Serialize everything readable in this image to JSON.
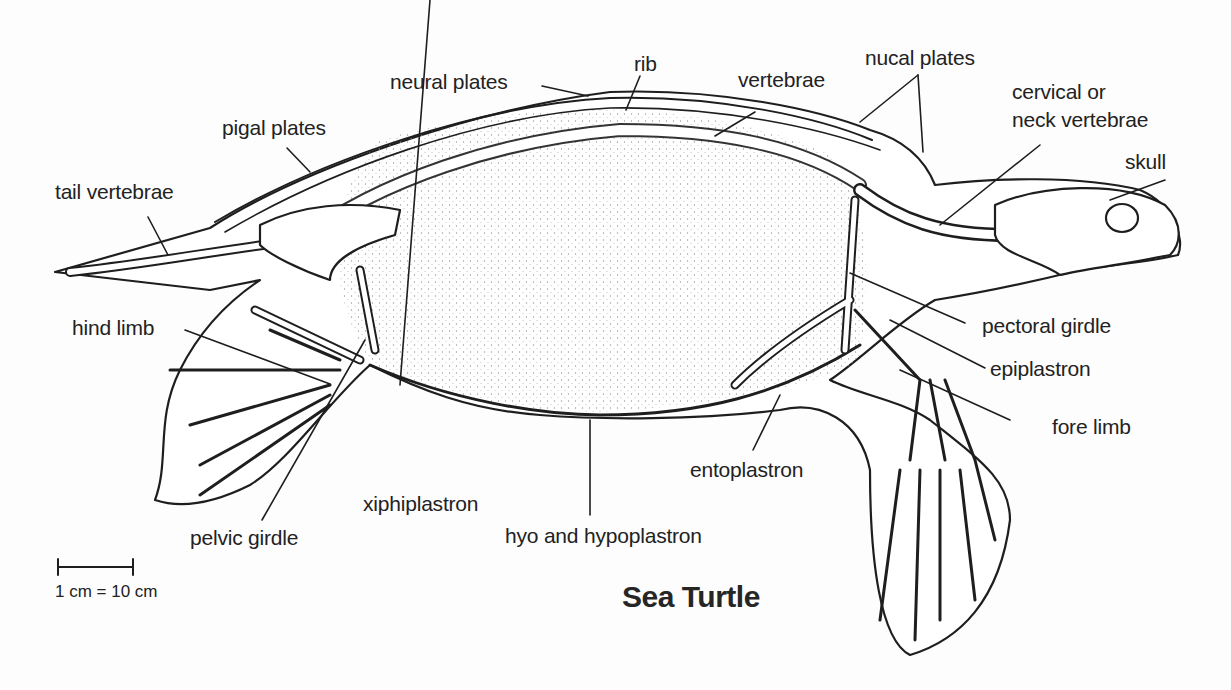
{
  "title": "Sea Turtle",
  "scale": {
    "label": "1 cm = 10 cm"
  },
  "labels": {
    "neural_plates": "neural plates",
    "rib": "rib",
    "vertebrae": "vertebrae",
    "nucal_plates": "nucal plates",
    "cervical_line1": "cervical or",
    "cervical_line2": "neck vertebrae",
    "skull": "skull",
    "pigal_plates": "pigal plates",
    "tail_vertebrae": "tail vertebrae",
    "hind_limb": "hind limb",
    "pectoral_girdle": "pectoral girdle",
    "epiplastron": "epiplastron",
    "fore_limb": "fore limb",
    "entoplastron": "entoplastron",
    "xiphiplastron": "xiphiplastron",
    "pelvic_girdle": "pelvic girdle",
    "hyo_and_hypoplastron": "hyo and hypoplastron"
  },
  "colors": {
    "ink": "#1e1e1e",
    "background": "#fdfdfd",
    "stipple": "#bdbdbd"
  }
}
